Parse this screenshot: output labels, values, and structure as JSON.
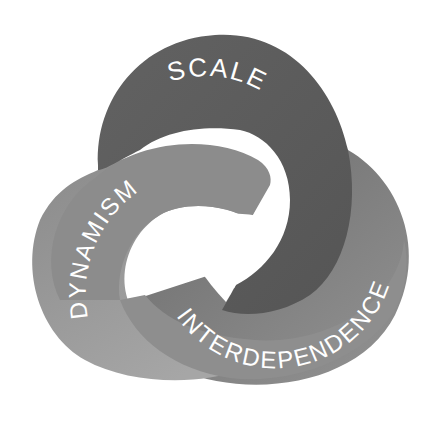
{
  "diagram": {
    "type": "interlocking-trefoil",
    "labels": {
      "top": "SCALE",
      "left": "DYNAMISM",
      "right": "INTERDEPENDENCE"
    },
    "colors": {
      "top_band": "#5e5e5e",
      "left_band": "#8b8b8b",
      "left_band_light": "#a3a3a3",
      "right_band": "#8f8f8f",
      "right_band_shadow": "#6b6b6b",
      "background": "#ffffff",
      "label": "#ffffff"
    }
  }
}
